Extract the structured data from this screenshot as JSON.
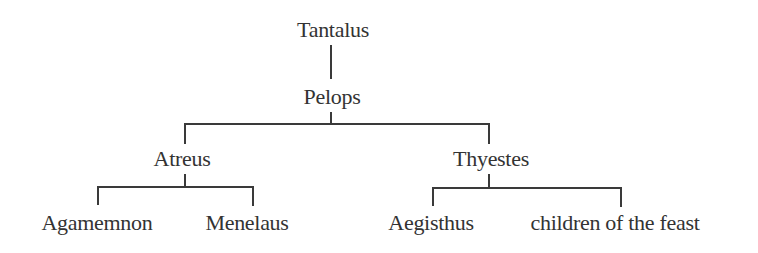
{
  "diagram": {
    "type": "family-tree",
    "nodes": {
      "tantalus": "Tantalus",
      "pelops": "Pelops",
      "atreus": "Atreus",
      "thyestes": "Thyestes",
      "agamemnon": "Agamemnon",
      "menelaus": "Menelaus",
      "aegisthus": "Aegisthus",
      "children_of_the_feast": "children of the feast"
    },
    "edges": [
      [
        "Tantalus",
        "Pelops"
      ],
      [
        "Pelops",
        "Atreus"
      ],
      [
        "Pelops",
        "Thyestes"
      ],
      [
        "Atreus",
        "Agamemnon"
      ],
      [
        "Atreus",
        "Menelaus"
      ],
      [
        "Thyestes",
        "Aegisthus"
      ],
      [
        "Thyestes",
        "children of the feast"
      ]
    ]
  }
}
